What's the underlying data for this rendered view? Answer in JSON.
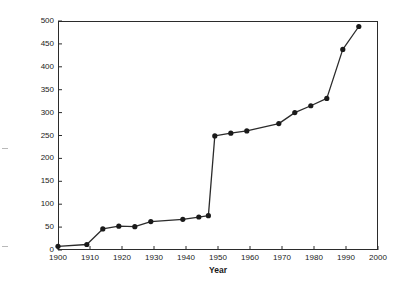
{
  "chart_data": {
    "type": "line",
    "title": "",
    "xlabel": "Year",
    "ylabel": "Total number of prescriptions written (millions)",
    "xlim": [
      1900,
      2000
    ],
    "ylim": [
      0,
      500
    ],
    "xticks": [
      1900,
      1910,
      1920,
      1930,
      1940,
      1950,
      1960,
      1970,
      1980,
      1990,
      2000
    ],
    "yticks": [
      0,
      50,
      100,
      150,
      200,
      250,
      300,
      350,
      400,
      450,
      500
    ],
    "grid": false,
    "legend": null,
    "marker": "filled-circle",
    "line_color": "#2b2b2b",
    "marker_color": "#1a1a1a",
    "series": [
      {
        "name": "Total prescriptions written",
        "x": [
          1900,
          1909,
          1914,
          1919,
          1924,
          1929,
          1939,
          1944,
          1947,
          1949,
          1954,
          1959,
          1969,
          1974,
          1979,
          1984,
          1989,
          1994
        ],
        "values": [
          8,
          12,
          46,
          52,
          51,
          62,
          67,
          72,
          75,
          249,
          255,
          260,
          276,
          300,
          315,
          331,
          438,
          488
        ]
      }
    ]
  },
  "axes": {
    "x_title": "Year",
    "y_title": "Total number of prescriptions written (millions)",
    "x_tick_labels": [
      "1900",
      "1910",
      "1920",
      "1930",
      "1940",
      "1950",
      "1960",
      "1970",
      "1980",
      "1990",
      "2000"
    ],
    "y_tick_labels": [
      "0",
      "50",
      "100",
      "150",
      "200",
      "250",
      "300",
      "350",
      "400",
      "450",
      "500"
    ]
  },
  "colors": {
    "axis": "#2b2b2b",
    "line": "#2b2b2b",
    "marker": "#1a1a1a",
    "background": "#ffffff",
    "text": "#1a1a1a"
  }
}
